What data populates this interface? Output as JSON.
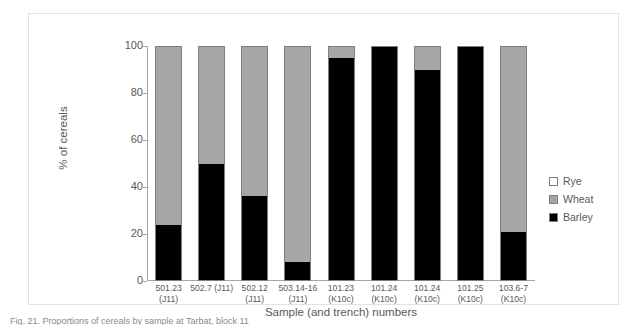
{
  "figure": {
    "caption": "Fig. 21. Proportions of cereals by sample at Tarbat, block 11"
  },
  "chart_data": {
    "type": "bar",
    "subtype": "stacked-100-percent",
    "title": "",
    "xlabel": "Sample (and trench) numbers",
    "ylabel": "% of cereals",
    "ylim": [
      0,
      100
    ],
    "yticks": [
      0,
      20,
      40,
      60,
      80,
      100
    ],
    "ytick_labels": [
      "0",
      "20",
      "40",
      "60",
      "80",
      "100"
    ],
    "grid": false,
    "legend_position": "right",
    "categories": [
      "501.23 (J11)",
      "502.7 (J11)",
      "502.12 (J11)",
      "503.14-16 (J11)",
      "101.23 (K10c)",
      "101.24 (K10c)",
      "101.24 (K10c)",
      "101.25 (K10c)",
      "103.6-7 (K10c)"
    ],
    "categories_lines": [
      [
        "501.23",
        "(J11)"
      ],
      [
        "502.7 (J11)",
        ""
      ],
      [
        "502.12",
        "(J11)"
      ],
      [
        "503.14-16",
        "(J11)"
      ],
      [
        "101.23",
        "(K10c)"
      ],
      [
        "101.24",
        "(K10c)"
      ],
      [
        "101.24",
        "(K10c)"
      ],
      [
        "101.25",
        "(K10c)"
      ],
      [
        "103.6-7",
        "(K10c)"
      ]
    ],
    "series": [
      {
        "name": "Barley",
        "color": "#000000",
        "values": [
          24,
          50,
          36,
          8,
          95,
          100,
          90,
          100,
          21
        ]
      },
      {
        "name": "Wheat",
        "color": "#a6a6a6",
        "values": [
          76,
          50,
          64,
          92,
          5,
          0,
          10,
          0,
          79
        ]
      },
      {
        "name": "Rye",
        "color": "#ffffff",
        "values": [
          0,
          0,
          0,
          0,
          0,
          0,
          0,
          0,
          0
        ]
      }
    ],
    "legend_order": [
      "Rye",
      "Wheat",
      "Barley"
    ]
  }
}
